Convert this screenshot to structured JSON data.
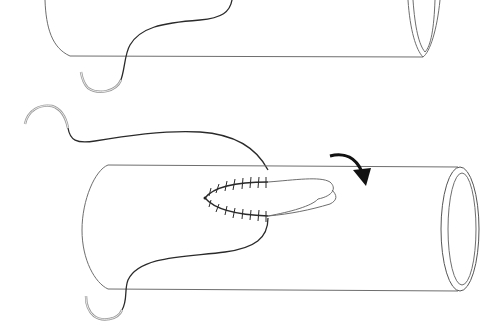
{
  "figure": {
    "panels": [
      {
        "id": "top",
        "content": "Tube segment with curved suture needle passing under it",
        "elements": [
          "tube",
          "tube-opening",
          "suture-thread",
          "curved-needle"
        ]
      },
      {
        "id": "bottom",
        "content": "Tube with incision closed by running suture, flap folded and rotation arrow",
        "elements": [
          "tube",
          "tube-opening",
          "running-suture",
          "tissue-flap",
          "rotation-arrow",
          "suture-thread",
          "curved-needle"
        ]
      }
    ],
    "colors": {
      "background": "#ffffff",
      "outline": "#6e6e6e",
      "suture": "#2a2a2a",
      "needle": "#999999",
      "arrow": "#111111"
    },
    "stitch_count": {
      "upper_row": 8,
      "lower_row": 8
    }
  }
}
